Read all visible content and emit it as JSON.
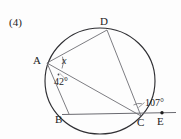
{
  "problem": {
    "number": "(4)"
  },
  "figure": {
    "type": "circle-geometry-diagram",
    "vertex_labels": {
      "a": "A",
      "b": "B",
      "c": "C",
      "d": "D",
      "e": "E"
    },
    "angle_labels": {
      "unknown": "x",
      "at_a": "42°",
      "at_c": "107°"
    },
    "colors": {
      "stroke": "#4a4a50",
      "circle": "#2b2b2b",
      "text": "#1c1c1c",
      "background": "#fdfdfd"
    },
    "geometry": {
      "circle": {
        "cx": 100,
        "cy": 81,
        "r": 54
      },
      "points": {
        "A": {
          "x": 47,
          "y": 63
        },
        "B": {
          "x": 68,
          "y": 114
        },
        "C": {
          "x": 141,
          "y": 116
        },
        "D": {
          "x": 107,
          "y": 30
        },
        "E": {
          "x": 162,
          "y": 113
        }
      },
      "chords": [
        {
          "from": "A",
          "to": "D"
        },
        {
          "from": "A",
          "to": "B"
        },
        {
          "from": "A",
          "to": "C"
        },
        {
          "from": "D",
          "to": "C"
        }
      ],
      "lines": [
        {
          "from": "B",
          "to": "E",
          "note": "horizontal line through B and C extended to E"
        }
      ]
    }
  }
}
